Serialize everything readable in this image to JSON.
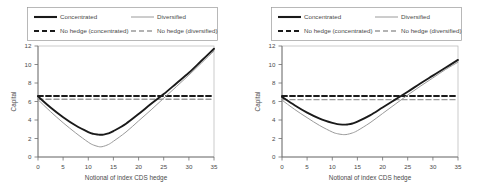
{
  "figure": {
    "panel_count": 2
  },
  "chart_data": [
    {
      "type": "line",
      "title": "",
      "xlabel": "Notional of index CDS hedge",
      "ylabel": "Capital",
      "xlim": [
        0,
        35
      ],
      "ylim": [
        0,
        12
      ],
      "xticks": [
        0,
        5,
        10,
        15,
        20,
        25,
        30,
        35
      ],
      "yticks": [
        0,
        2,
        4,
        6,
        8,
        10,
        12
      ],
      "grid": false,
      "legend_position": "above-plot",
      "legend": [
        {
          "label": "Concentrated",
          "style": "solid",
          "color": "#1a1a1a",
          "width": 1.9
        },
        {
          "label": "Diversified",
          "style": "solid",
          "color": "#9a9a9a",
          "width": 1.0
        },
        {
          "label": "No hedge (concentrated)",
          "style": "dashed",
          "color": "#1a1a1a",
          "width": 1.9
        },
        {
          "label": "No hedge (diversified)",
          "style": "dashed",
          "color": "#9a9a9a",
          "width": 1.4
        }
      ],
      "series": [
        {
          "name": "Concentrated",
          "style": "solid",
          "color": "#1a1a1a",
          "x": [
            0,
            2.5,
            5,
            7.5,
            10,
            11,
            12,
            12.5,
            13,
            14,
            15,
            17.5,
            20,
            22.5,
            25,
            27.5,
            30,
            32.5,
            35
          ],
          "y": [
            6.55,
            5.35,
            4.3,
            3.4,
            2.7,
            2.5,
            2.42,
            2.4,
            2.42,
            2.55,
            2.8,
            3.6,
            4.65,
            5.75,
            6.8,
            7.95,
            9.1,
            10.4,
            11.7
          ]
        },
        {
          "name": "Diversified",
          "style": "solid",
          "color": "#9a9a9a",
          "x": [
            0,
            2.5,
            5,
            7.5,
            10,
            11,
            12,
            12.5,
            13,
            14,
            15,
            17.5,
            20,
            22.5,
            25,
            27.5,
            30,
            32.5,
            35
          ],
          "y": [
            6.2,
            4.9,
            3.7,
            2.6,
            1.6,
            1.3,
            1.13,
            1.1,
            1.15,
            1.35,
            1.7,
            2.7,
            3.9,
            5.1,
            6.35,
            7.6,
            8.85,
            10.15,
            11.45
          ]
        },
        {
          "name": "No hedge (concentrated)",
          "style": "dashed",
          "color": "#1a1a1a",
          "x": [
            0,
            35
          ],
          "y": [
            6.6,
            6.6
          ]
        },
        {
          "name": "No hedge (diversified)",
          "style": "dashed",
          "color": "#9a9a9a",
          "x": [
            0,
            35
          ],
          "y": [
            6.25,
            6.25
          ]
        }
      ]
    },
    {
      "type": "line",
      "title": "",
      "xlabel": "Notional of index CDS hedge",
      "ylabel": "Capital",
      "xlim": [
        0,
        35
      ],
      "ylim": [
        0,
        12
      ],
      "xticks": [
        0,
        5,
        10,
        15,
        20,
        25,
        30,
        35
      ],
      "yticks": [
        0,
        2,
        4,
        6,
        8,
        10,
        12
      ],
      "grid": false,
      "legend_position": "above-plot",
      "legend": [
        {
          "label": "Concentrated",
          "style": "solid",
          "color": "#1a1a1a",
          "width": 1.9
        },
        {
          "label": "Diversified",
          "style": "solid",
          "color": "#9a9a9a",
          "width": 1.0
        },
        {
          "label": "No hedge (concentrated)",
          "style": "dashed",
          "color": "#1a1a1a",
          "width": 1.9
        },
        {
          "label": "No hedge (diversified)",
          "style": "dashed",
          "color": "#9a9a9a",
          "width": 1.4
        }
      ],
      "series": [
        {
          "name": "Concentrated",
          "style": "solid",
          "color": "#1a1a1a",
          "x": [
            0,
            2.5,
            5,
            7.5,
            10,
            11,
            12,
            12.5,
            13,
            14,
            15,
            17.5,
            20,
            22.5,
            25,
            27.5,
            30,
            32.5,
            35
          ],
          "y": [
            6.5,
            5.6,
            4.8,
            4.15,
            3.68,
            3.56,
            3.5,
            3.5,
            3.52,
            3.62,
            3.82,
            4.5,
            5.35,
            6.2,
            7.05,
            7.95,
            8.8,
            9.65,
            10.5
          ]
        },
        {
          "name": "Diversified",
          "style": "solid",
          "color": "#9a9a9a",
          "x": [
            0,
            2.5,
            5,
            7.5,
            10,
            11,
            12,
            12.5,
            13,
            14,
            15,
            17.5,
            20,
            22.5,
            25,
            27.5,
            30,
            32.5,
            35
          ],
          "y": [
            6.15,
            5.15,
            4.25,
            3.4,
            2.7,
            2.52,
            2.43,
            2.42,
            2.45,
            2.6,
            2.85,
            3.7,
            4.7,
            5.7,
            6.7,
            7.65,
            8.55,
            9.45,
            10.25
          ]
        },
        {
          "name": "No hedge (concentrated)",
          "style": "dashed",
          "color": "#1a1a1a",
          "x": [
            0,
            35
          ],
          "y": [
            6.6,
            6.6
          ]
        },
        {
          "name": "No hedge (diversified)",
          "style": "dashed",
          "color": "#9a9a9a",
          "x": [
            0,
            35
          ],
          "y": [
            6.2,
            6.2
          ]
        }
      ]
    }
  ]
}
